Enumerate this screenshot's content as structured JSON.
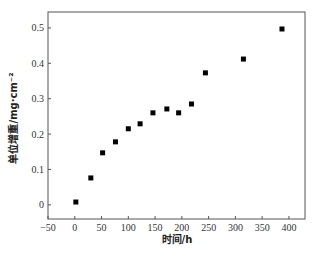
{
  "chart_data": {
    "type": "scatter",
    "title": "",
    "xlabel": "时间/h",
    "ylabel": "单位增重/mg·cm⁻²",
    "xlim": [
      -50,
      430
    ],
    "ylim": [
      -0.04,
      0.545
    ],
    "xticks": [
      -50,
      0,
      50,
      100,
      150,
      200,
      250,
      300,
      350,
      400
    ],
    "yticks": [
      0,
      0.1,
      0.2,
      0.3,
      0.4,
      0.5
    ],
    "xtick_labels": [
      "−50",
      "0",
      "50",
      "100",
      "150",
      "200",
      "250",
      "300",
      "350",
      "400"
    ],
    "ytick_labels": [
      "0",
      "0.1",
      "0.2",
      "0.3",
      "0.4",
      "0.5"
    ],
    "grid": false,
    "legend": null,
    "marker": "square",
    "marker_color": "#000000",
    "series": [
      {
        "name": "单位增重",
        "x": [
          2,
          30,
          52,
          76,
          100,
          122,
          146,
          172,
          194,
          218,
          244,
          315,
          387
        ],
        "y": [
          0.008,
          0.076,
          0.147,
          0.178,
          0.215,
          0.229,
          0.26,
          0.271,
          0.26,
          0.285,
          0.373,
          0.412,
          0.497
        ]
      }
    ]
  }
}
